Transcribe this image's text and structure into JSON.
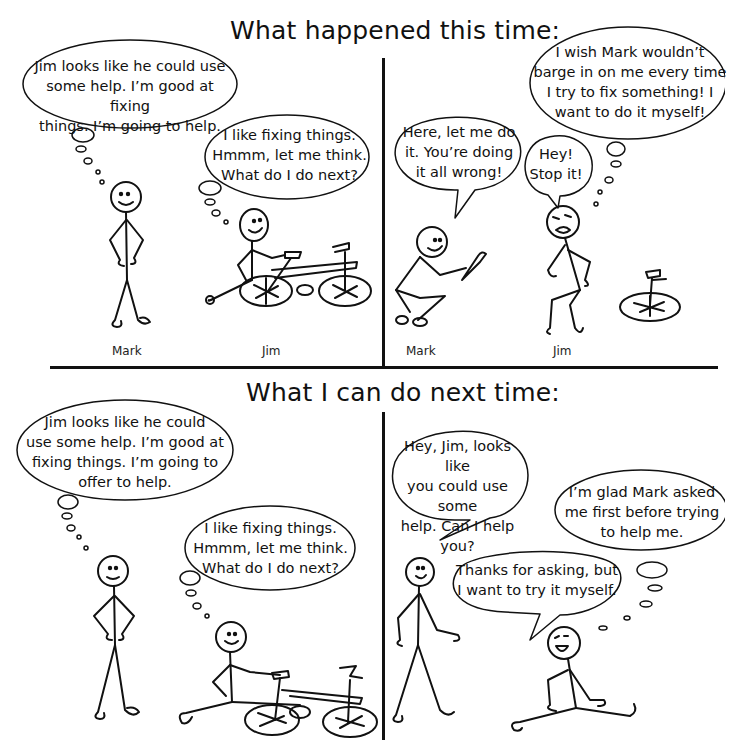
{
  "comic": {
    "top_title": "What happened this time:",
    "bottom_title": "What I can do next time:",
    "panels": [
      {
        "id": "top-left",
        "bubbles": [
          {
            "type": "thought",
            "speaker": "Mark",
            "text": "Jim looks like he could use\nsome help.  I’m good at fixing\nthings. I’m going to help."
          },
          {
            "type": "thought",
            "speaker": "Jim",
            "text": "I like fixing things.\nHmmm, let me think.\nWhat do I do next?"
          }
        ],
        "labels": [
          "Mark",
          "Jim"
        ]
      },
      {
        "id": "top-right",
        "bubbles": [
          {
            "type": "speech",
            "speaker": "Mark",
            "text": "Here, let me do\nit. You’re doing\nit all wrong!"
          },
          {
            "type": "speech",
            "speaker": "Jim",
            "text": "Hey!\nStop it!"
          },
          {
            "type": "thought",
            "speaker": "Jim",
            "text": "I wish Mark wouldn’t\nbarge in on me every time\nI try to fix something! I\nwant to do it myself!"
          }
        ],
        "labels": [
          "Mark",
          "Jim"
        ]
      },
      {
        "id": "bottom-left",
        "bubbles": [
          {
            "type": "thought",
            "speaker": "Mark",
            "text": "Jim looks like he could\nuse some help.  I’m good at\nfixing things. I’m going to\noffer to help."
          },
          {
            "type": "thought",
            "speaker": "Jim",
            "text": "I like fixing things.\nHmmm, let me think.\nWhat do I do next?"
          }
        ]
      },
      {
        "id": "bottom-right",
        "bubbles": [
          {
            "type": "speech",
            "speaker": "Mark",
            "text": "Hey, Jim, looks like\nyou could use some\nhelp. Can I help you?"
          },
          {
            "type": "thought",
            "speaker": "Jim",
            "text": "I’m glad Mark asked\nme first before trying\nto help me."
          },
          {
            "type": "speech",
            "speaker": "Jim",
            "text": "Thanks for asking, but\nI want to try it myself."
          }
        ]
      }
    ]
  },
  "colors": {
    "ink": "#111111",
    "paper": "#ffffff"
  }
}
